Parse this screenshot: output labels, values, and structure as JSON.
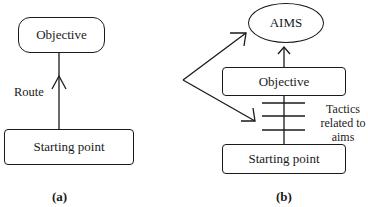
{
  "panel_a": {
    "objective": "Objective",
    "route": "Route",
    "starting_point": "Starting point",
    "caption": "(a)"
  },
  "panel_b": {
    "aims": "AIMS",
    "objective": "Objective",
    "tactics_line1": "Tactics",
    "tactics_line2": "related to",
    "tactics_line3": "aims",
    "starting_point": "Starting point",
    "caption": "(b)"
  }
}
